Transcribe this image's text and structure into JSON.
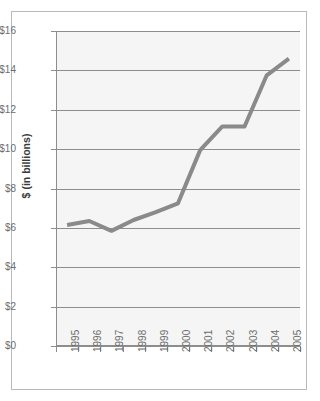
{
  "chart_data": {
    "type": "line",
    "title": "",
    "xlabel": "",
    "ylabel": "$ (in billions)",
    "categories": [
      "1995",
      "1996",
      "1997",
      "1998",
      "1999",
      "2000",
      "2001",
      "2002",
      "2003",
      "2004",
      "2005"
    ],
    "values": [
      6.15,
      6.35,
      5.85,
      6.4,
      6.8,
      7.25,
      9.95,
      11.15,
      11.15,
      13.75,
      14.6
    ],
    "series": [
      {
        "name": "$ (in billions)",
        "values": [
          6.15,
          6.35,
          5.85,
          6.4,
          6.8,
          7.25,
          9.95,
          11.15,
          11.15,
          13.75,
          14.6
        ]
      }
    ],
    "ylim": [
      0,
      16
    ],
    "ytick_values": [
      0,
      2,
      4,
      6,
      8,
      10,
      12,
      14,
      16
    ],
    "ytick_labels": [
      "$0",
      "$2",
      "$4",
      "$6",
      "$8",
      "$10",
      "$12",
      "$14",
      "$16"
    ],
    "grid": true,
    "legend": "none",
    "line_color": "#8a8a8a",
    "plot_background": "#f5f5f5",
    "axis_color": "#8d8d8d",
    "tick_label_color": "#6d6d6d",
    "axis_title_color": "#3a3a3a"
  }
}
